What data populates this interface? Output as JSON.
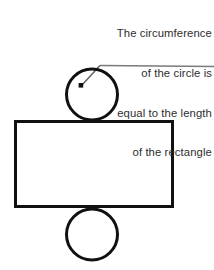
{
  "figure": {
    "name": "circle-rectangle-circumference-diagram",
    "background_color": "#ffffff",
    "stroke_color": "#111111",
    "leader_color": "#7a7a7a",
    "text_color": "#2e2e2e",
    "annotation": {
      "lines": [
        "The circumference",
        "of the circle is",
        "equal to the length",
        "of the rectangle"
      ],
      "align": "right"
    },
    "shapes": {
      "top_circle": {
        "label": "top-circle",
        "cx": 92,
        "cy": 94.5,
        "r": 25.5,
        "stroke_width": 3
      },
      "bottom_circle": {
        "label": "bottom-circle",
        "cx": 92,
        "cy": 234.5,
        "r": 25.5,
        "stroke_width": 3
      },
      "rectangle": {
        "label": "rectangle",
        "x": 15.5,
        "y": 121.5,
        "width": 157,
        "height": 85,
        "stroke_width": 3
      }
    },
    "leader": {
      "label": "callout-leader-line",
      "horizontal_y": 66,
      "horizontal_x_start": 100,
      "horizontal_x_end": 214,
      "elbow_x": 100,
      "elbow_y": 65,
      "point_x": 81,
      "point_y": 85,
      "stroke_width": 1.2,
      "dot_size": 4
    }
  }
}
